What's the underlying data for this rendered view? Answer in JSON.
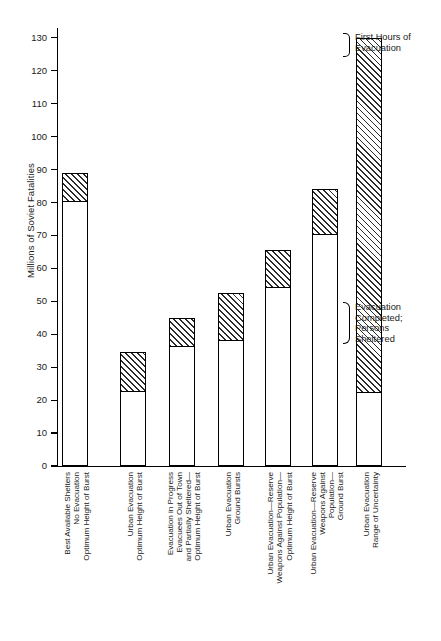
{
  "chart_data": {
    "type": "bar",
    "title": "",
    "subtitle": "",
    "xlabel": "",
    "ylabel": "Millions of Soviet Fatalities",
    "ylim": [
      0,
      133
    ],
    "ytick_values": [
      0,
      10,
      20,
      30,
      40,
      50,
      60,
      70,
      80,
      90,
      100,
      110,
      120,
      130
    ],
    "ytick_labels": [
      "0",
      "10",
      "20",
      "30",
      "40",
      "50",
      "60",
      "70",
      "80",
      "90",
      "100",
      "110",
      "120",
      "130"
    ],
    "grid": false,
    "legend_position": "none",
    "stacked": true,
    "segment_names": [
      "Evacuation Completed; Persons Sheltered",
      "First Hours of Evacuation"
    ],
    "categories": [
      "Best Available Shelters\nNo Evacuation\nOptimum Height of Burst",
      "Urban Evacuation\nOptimum Height of Burst",
      "Evacuation in Progress\nEvacuees Out of Town\nand Partially Sheltered—\nOptimum Height of Burst",
      "Urban Evacuation\nGround Bursts",
      "Urban Evacuation—Reserve\nWeapons Against Population—\nOptimum Height of Burst",
      "Urban Evacuation—Reserve\nPopulation—\nGround Burst",
      "Urban Evacuation\nRange of Uncertainty"
    ],
    "category_lines": [
      [
        "Best Available Shelters",
        "No Evacuation",
        "Optimum Height of Burst"
      ],
      [
        "Urban Evacuation",
        "Optimum Height of Burst"
      ],
      [
        "Evacuation in Progress",
        "Evacuees Out of Town",
        "and Partially Sheltered—",
        "Optimum Height of Burst"
      ],
      [
        "Urban Evacuation",
        "Ground Bursts"
      ],
      [
        "Urban Evacuation—Reserve",
        "Weapons Against Population—",
        "Optimum Height of Burst"
      ],
      [
        "Urban Evacuation—Reserve",
        "Weapons Against",
        "Population—",
        "Ground Burst"
      ],
      [
        "Urban Evacuation",
        "Range of Uncertainty"
      ]
    ],
    "bars": [
      {
        "category_index": 0,
        "base": 0,
        "plain_top": 80,
        "hatch_top": 89,
        "total": 89
      },
      {
        "category_index": 1,
        "base": 0,
        "plain_top": 22.5,
        "hatch_top": 34.5,
        "total": 34.5
      },
      {
        "category_index": 2,
        "base": 0,
        "plain_top": 36,
        "hatch_top": 45,
        "total": 45
      },
      {
        "category_index": 3,
        "base": 0,
        "plain_top": 38,
        "hatch_top": 52.5,
        "total": 52.5
      },
      {
        "category_index": 4,
        "base": 0,
        "plain_top": 54,
        "hatch_top": 65.5,
        "total": 65.5
      },
      {
        "category_index": 5,
        "base": 0,
        "plain_top": 70,
        "hatch_top": 84,
        "total": 84
      },
      {
        "category_index": 6,
        "base": 0,
        "plain_top": 22,
        "hatch_top": 130,
        "total": 130
      }
    ],
    "series": [
      {
        "name": "Evacuation Completed; Persons Sheltered",
        "values": [
          80,
          22.5,
          36,
          38,
          54,
          70,
          22
        ]
      },
      {
        "name": "First Hours of Evacuation",
        "values": [
          9,
          12,
          9,
          14.5,
          11.5,
          14,
          108
        ]
      }
    ],
    "annotations": [
      {
        "id": "first-hours",
        "lines": [
          "First Hours of",
          "Evacuation"
        ]
      },
      {
        "id": "evac-completed",
        "lines": [
          "Evacuation",
          "Completed;",
          "Persons",
          "Sheltered"
        ]
      }
    ]
  },
  "colors": {
    "ink": "#1a1a1a",
    "axis": "#000000",
    "bar_fill": "#ffffff",
    "hatch": "#2b2b2b",
    "background": "#ffffff"
  }
}
